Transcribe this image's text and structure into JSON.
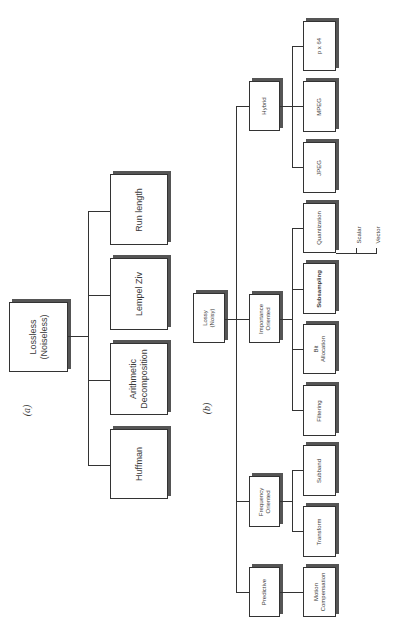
{
  "figure": {
    "panel_a": {
      "label": "(a)",
      "root": {
        "line1": "Lossless",
        "line2": "(Noiseless)"
      },
      "children": [
        {
          "line1": "Run length",
          "line2": ""
        },
        {
          "line1": "Lempel Ziv",
          "line2": ""
        },
        {
          "line1": "Arithmetic",
          "line2": "Decomposition"
        },
        {
          "line1": "Huffman",
          "line2": ""
        }
      ]
    },
    "panel_b": {
      "label": "(b)",
      "root": {
        "line1": "Lossy",
        "line2": "(Noisy)"
      },
      "categories": [
        {
          "line1": "Hybrid",
          "line2": "",
          "children": [
            {
              "line1": "p x 64",
              "line2": ""
            },
            {
              "line1": "MPEG",
              "line2": ""
            },
            {
              "line1": "JPEG",
              "line2": ""
            }
          ]
        },
        {
          "line1": "Importance",
          "line2": "Oriented",
          "children": [
            {
              "line1": "Quantization",
              "line2": ""
            },
            {
              "line1": "Subsampling",
              "line2": ""
            },
            {
              "line1": "Bit",
              "line2": "Allocation"
            },
            {
              "line1": "Filtering",
              "line2": ""
            }
          ]
        },
        {
          "line1": "Frequency",
          "line2": "Oriented",
          "children": [
            {
              "line1": "Subband",
              "line2": ""
            },
            {
              "line1": "Transform",
              "line2": ""
            }
          ]
        },
        {
          "line1": "Predictive",
          "line2": "",
          "children": [
            {
              "line1": "Motion",
              "line2": "Compensation"
            }
          ]
        }
      ],
      "quantization_types": [
        "Scalar",
        "Vector"
      ]
    }
  }
}
